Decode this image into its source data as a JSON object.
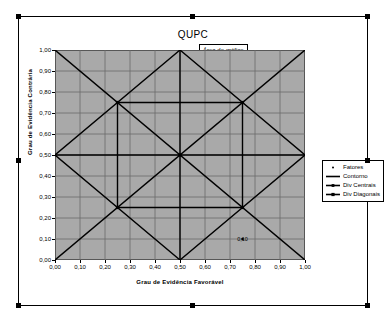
{
  "chart": {
    "title": "QUPC",
    "tooltip": "Área do gráfico",
    "plot_bg_color": "#a9a9a9",
    "grid_color": "#6b6b6b",
    "series_color": "#000000"
  },
  "axes": {
    "x": {
      "title": "Grau de Evidência Favorável",
      "ticks": [
        "0,00",
        "0,10",
        "0,20",
        "0,30",
        "0,40",
        "0,50",
        "0,60",
        "0,70",
        "0,80",
        "0,90",
        "1,00"
      ],
      "min": 0,
      "max": 1
    },
    "y": {
      "title": "Grau de Evidência Contrária",
      "ticks": [
        "0,00",
        "0,10",
        "0,20",
        "0,30",
        "0,40",
        "0,50",
        "0,60",
        "0,70",
        "0,80",
        "0,90",
        "1,00"
      ],
      "min": 0,
      "max": 1
    }
  },
  "legend": {
    "items": [
      {
        "label": "Fatores",
        "marker": "dot",
        "color": "#000000"
      },
      {
        "label": "Contorno",
        "marker": "line",
        "color": "#000000"
      },
      {
        "label": "Div Centrais",
        "marker": "line-dot",
        "color": "#000000"
      },
      {
        "label": "Div Diagonais",
        "marker": "line-marker",
        "color": "#000000"
      }
    ]
  },
  "annotations": [
    {
      "text": "0,10",
      "x": 0.75,
      "y": 0.1
    }
  ],
  "chart_data": {
    "type": "line",
    "title": "QUPC",
    "xlabel": "Grau de Evidência Favorável",
    "ylabel": "Grau de Evidência Contrária",
    "xlim": [
      0,
      1
    ],
    "ylim": [
      0,
      1
    ],
    "grid": true,
    "legend_position": "right",
    "xticks": [
      0,
      0.1,
      0.2,
      0.3,
      0.4,
      0.5,
      0.6,
      0.7,
      0.8,
      0.9,
      1.0
    ],
    "yticks": [
      0,
      0.1,
      0.2,
      0.3,
      0.4,
      0.5,
      0.6,
      0.7,
      0.8,
      0.9,
      1.0
    ],
    "series": [
      {
        "name": "Fatores",
        "type": "scatter",
        "points": [
          {
            "x": 0.75,
            "y": 0.1,
            "label": "0,10"
          }
        ]
      },
      {
        "name": "Contorno",
        "type": "line",
        "closed": true,
        "points": [
          {
            "x": 0.5,
            "y": 1.0
          },
          {
            "x": 1.0,
            "y": 0.5
          },
          {
            "x": 0.5,
            "y": 0.0
          },
          {
            "x": 0.0,
            "y": 0.5
          }
        ]
      },
      {
        "name": "Div Centrais",
        "type": "line",
        "segments": [
          [
            {
              "x": 0.0,
              "y": 0.5
            },
            {
              "x": 1.0,
              "y": 0.5
            }
          ],
          [
            {
              "x": 0.5,
              "y": 0.0
            },
            {
              "x": 0.5,
              "y": 1.0
            }
          ]
        ]
      },
      {
        "name": "Div Diagonais",
        "type": "line",
        "segments": [
          [
            {
              "x": 0.0,
              "y": 0.0
            },
            {
              "x": 1.0,
              "y": 1.0
            }
          ],
          [
            {
              "x": 0.0,
              "y": 1.0
            },
            {
              "x": 1.0,
              "y": 0.0
            }
          ]
        ],
        "markers": [
          {
            "x": 0.25,
            "y": 0.75
          },
          {
            "x": 0.75,
            "y": 0.75
          },
          {
            "x": 0.25,
            "y": 0.25
          },
          {
            "x": 0.75,
            "y": 0.25
          }
        ]
      },
      {
        "name": "Losango Interno",
        "type": "line",
        "closed": true,
        "points": [
          {
            "x": 0.25,
            "y": 0.75
          },
          {
            "x": 0.75,
            "y": 0.75
          },
          {
            "x": 0.75,
            "y": 0.25
          },
          {
            "x": 0.25,
            "y": 0.25
          }
        ]
      }
    ]
  }
}
